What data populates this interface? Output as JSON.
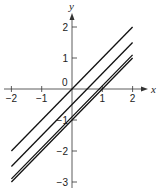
{
  "chart_data": {
    "type": "line",
    "title": "",
    "xlabel": "x",
    "ylabel": "y",
    "xlim": [
      -2,
      2
    ],
    "ylim": [
      -3,
      2
    ],
    "grid": false,
    "legend": null,
    "x_ticks": [
      -2,
      -1,
      1,
      2
    ],
    "x_tick_labels": [
      "−2",
      "−1",
      "1",
      "2"
    ],
    "y_ticks": [
      2,
      1,
      -1,
      -2,
      -3
    ],
    "y_tick_labels": [
      "2",
      "1",
      "−1",
      "−2",
      "−3"
    ],
    "origin_label": "0",
    "series": [
      {
        "name": "y = x",
        "x": [
          -2,
          2
        ],
        "y": [
          -2,
          2
        ]
      },
      {
        "name": "y = x − 0.5",
        "x": [
          -2,
          2
        ],
        "y": [
          -2.5,
          1.5
        ]
      },
      {
        "name": "y = x − 0.9",
        "x": [
          -2,
          2
        ],
        "y": [
          -2.9,
          1.1
        ]
      },
      {
        "name": "y = x − 1",
        "x": [
          -2,
          2
        ],
        "y": [
          -3,
          1
        ]
      }
    ],
    "colors": {
      "line": "#111111",
      "axis": "#333333"
    }
  }
}
